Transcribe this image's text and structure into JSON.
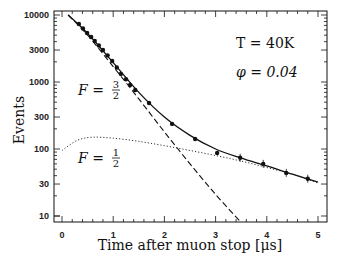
{
  "chart_data": {
    "type": "line",
    "title": "",
    "xlabel": "Time after muon stop [μs]",
    "ylabel": "Events",
    "xlim": [
      0,
      5
    ],
    "ylim": [
      10,
      10000
    ],
    "yscale": "log",
    "grid": false,
    "x_ticks": [
      "0",
      "1",
      "2",
      "3",
      "4",
      "5"
    ],
    "y_ticks": [
      "10",
      "30",
      "100",
      "300",
      "1000",
      "3000",
      "10000"
    ],
    "annotations": [
      {
        "text": "T = 40K",
        "x": 3.6,
        "y": 4000
      },
      {
        "text": "φ = 0.04",
        "x": 3.6,
        "y": 2000
      },
      {
        "text": "F = 3/2",
        "x": 0.35,
        "y": 900,
        "refers_to": "dashed"
      },
      {
        "text": "F = 1/2",
        "x": 0.35,
        "y": 75,
        "refers_to": "dotted"
      }
    ],
    "series": [
      {
        "name": "Data",
        "style": "points with error bars",
        "x": [
          0.33,
          0.41,
          0.49,
          0.57,
          0.64,
          0.72,
          0.8,
          0.89,
          0.98,
          1.07,
          1.15,
          1.25,
          1.33,
          1.43,
          1.7,
          2.15,
          2.6,
          3.03,
          3.48,
          3.93,
          4.38,
          4.8
        ],
        "y": [
          7340,
          6300,
          5390,
          4700,
          4090,
          3500,
          3000,
          2500,
          2060,
          1650,
          1320,
          1100,
          900,
          760,
          485,
          237,
          141,
          87,
          74,
          60,
          44,
          36
        ]
      },
      {
        "name": "Fit (total)",
        "style": "solid",
        "x": [
          0.12,
          0.5,
          1.0,
          1.5,
          2.0,
          2.5,
          3.0,
          3.5,
          4.0,
          4.5,
          5.0
        ],
        "y": [
          10000,
          5300,
          1950,
          700,
          300,
          160,
          100,
          73,
          56,
          42,
          32
        ]
      },
      {
        "name": "F = 3/2",
        "style": "dashed",
        "x": [
          0.12,
          0.5,
          1.0,
          1.5,
          2.0,
          2.5,
          3.0,
          3.5
        ],
        "y": [
          10000,
          5000,
          1700,
          560,
          180,
          60,
          21,
          8
        ]
      },
      {
        "name": "F = 1/2",
        "style": "dotted",
        "x": [
          0.0,
          0.3,
          0.6,
          1.0,
          1.5,
          2.0,
          2.5,
          3.0,
          3.5,
          4.0,
          4.5,
          5.0
        ],
        "y": [
          95,
          135,
          150,
          145,
          130,
          112,
          95,
          80,
          66,
          53,
          42,
          31
        ]
      }
    ]
  },
  "labels": {
    "xlabel": "Time after muon stop [μs]",
    "ylabel": "Events",
    "temp": "T = 40K",
    "phi": "φ = 0.04",
    "f32_prefix": "F =",
    "f32_num": "3",
    "f32_den": "2",
    "f12_prefix": "F =",
    "f12_num": "1",
    "f12_den": "2"
  }
}
